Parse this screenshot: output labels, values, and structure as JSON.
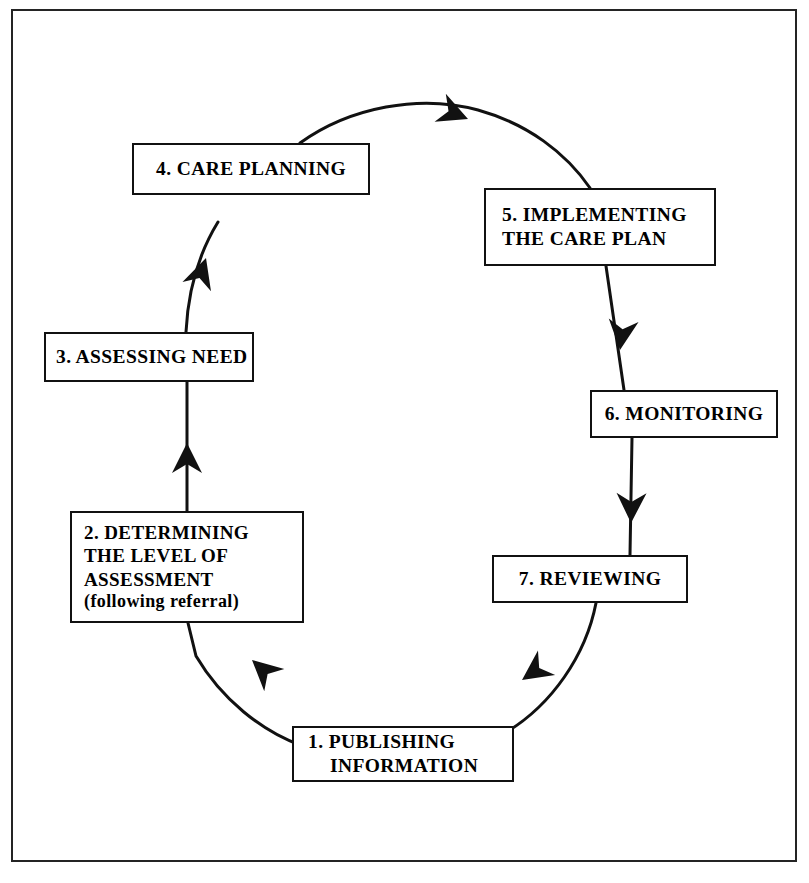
{
  "diagram": {
    "type": "cyclical-process-flow",
    "direction": "clockwise",
    "line_color": "#111111",
    "box_border_color": "#111111",
    "background_color": "#ffffff",
    "border_color": "#242424",
    "stage_count": 7,
    "stages": [
      {
        "number": "1.",
        "name": "publishing-information",
        "lines": [
          "1.  PUBLISHING",
          "INFORMATION"
        ],
        "position": "bottom-center"
      },
      {
        "number": "2.",
        "name": "determining-level-of-assessment",
        "lines": [
          "2.  DETERMINING",
          "THE LEVEL OF",
          "ASSESSMENT"
        ],
        "sub_line": "(following referral)",
        "position": "lower-left"
      },
      {
        "number": "3.",
        "name": "assessing-need",
        "lines": [
          "3.  ASSESSING NEED"
        ],
        "position": "middle-left"
      },
      {
        "number": "4.",
        "name": "care-planning",
        "lines": [
          "4.  CARE PLANNING"
        ],
        "position": "upper-left"
      },
      {
        "number": "5.",
        "name": "implementing-the-care-plan",
        "lines": [
          "5.  IMPLEMENTING",
          "THE CARE PLAN"
        ],
        "position": "upper-right"
      },
      {
        "number": "6.",
        "name": "monitoring",
        "lines": [
          "6.  MONITORING"
        ],
        "position": "middle-right"
      },
      {
        "number": "7.",
        "name": "reviewing",
        "lines": [
          "7.  REVIEWING"
        ],
        "position": "lower-right"
      }
    ],
    "arrows": [
      {
        "name": "arrow-publishing-to-determining",
        "from": "1",
        "to": "2",
        "direction": "up-left"
      },
      {
        "name": "arrow-determining-to-assessing",
        "from": "2",
        "to": "3",
        "direction": "up"
      },
      {
        "name": "arrow-assessing-to-care-planning",
        "from": "3",
        "to": "4",
        "direction": "up"
      },
      {
        "name": "arrow-care-planning-to-implementing",
        "from": "4",
        "to": "5",
        "direction": "right"
      },
      {
        "name": "arrow-implementing-to-monitoring",
        "from": "5",
        "to": "6",
        "direction": "down"
      },
      {
        "name": "arrow-monitoring-to-reviewing",
        "from": "6",
        "to": "7",
        "direction": "down"
      },
      {
        "name": "arrow-reviewing-to-publishing",
        "from": "7",
        "to": "1",
        "direction": "down-left"
      }
    ]
  }
}
